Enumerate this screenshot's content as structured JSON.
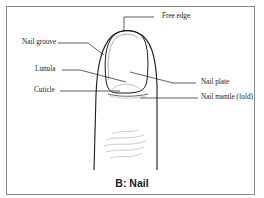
{
  "figure": {
    "caption": "B: Nail",
    "border_color": "#8a8a8a",
    "line_color": "#1a1a1a"
  },
  "labels": {
    "free_edge": "Free edge",
    "nail_groove": "Nail groove",
    "lunula": "Lunula",
    "cuticle": "Cuticle",
    "nail_plate": "Nail plate",
    "nail_mantle": "Nail mantle (fold)"
  }
}
